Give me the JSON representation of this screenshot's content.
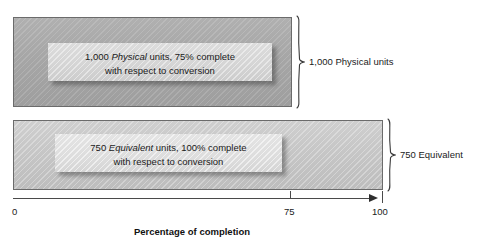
{
  "figure": {
    "title": "Percentage of completion"
  },
  "bars": [
    {
      "key": "physical",
      "caption_line1_pre": "1,000 ",
      "caption_line1_em": "Physical",
      "caption_line1_post": " units, 75% complete",
      "caption_line2": "with respect to conversion",
      "brace_label": "1,000 Physical units",
      "units": 1000,
      "unit_type": "Physical",
      "percent_complete": 75,
      "fill_color": "#a6a6a6",
      "border_color": "#6b6b6b"
    },
    {
      "key": "equivalent",
      "caption_line1_pre": "750 ",
      "caption_line1_em": "Equivalent",
      "caption_line1_post": " units, 100% complete",
      "caption_line2": "with respect to conversion",
      "brace_label": "750 Equivalent",
      "units": 750,
      "unit_type": "Equivalent",
      "percent_complete": 100,
      "fill_color": "#c6c6c6",
      "border_color": "#6b6b6b"
    }
  ],
  "axis": {
    "label": "Percentage of completion",
    "ticks": [
      {
        "value": "0"
      },
      {
        "value": "75"
      },
      {
        "value": "100"
      }
    ],
    "min": 0,
    "max": 100,
    "arrow_direction": "right",
    "line_color": "#4a4a4a"
  }
}
